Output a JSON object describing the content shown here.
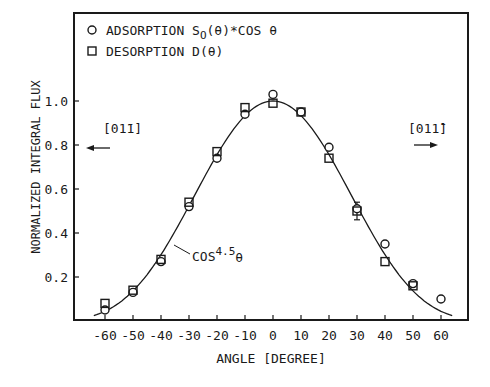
{
  "chart_data": {
    "type": "scatter",
    "title": "",
    "xlabel": "ANGLE [DEGREE]",
    "ylabel": "NORMALIZED INTEGRAL FLUX",
    "xlim": [
      -65,
      69
    ],
    "ylim": [
      0,
      1.0
    ],
    "x_ticks": [
      -60,
      -50,
      -40,
      -30,
      -20,
      -10,
      0,
      10,
      20,
      30,
      40,
      50,
      60
    ],
    "y_ticks": [
      0.2,
      0.4,
      0.6,
      0.8,
      1.0
    ],
    "y_tick_labels": [
      "0.2",
      "0.4",
      "0.6",
      "0.8",
      "1.0"
    ],
    "grid": false,
    "legend_position": "top-left",
    "series": [
      {
        "name": "ADSORPTION S_0(θ)*COS θ",
        "marker": "circle",
        "x": [
          -60,
          -50,
          -40,
          -30,
          -20,
          -10,
          0,
          10,
          20,
          30,
          40,
          50,
          60
        ],
        "values": [
          0.05,
          0.13,
          0.27,
          0.52,
          0.74,
          0.94,
          1.03,
          0.95,
          0.79,
          0.51,
          0.35,
          0.17,
          0.1
        ]
      },
      {
        "name": "DESORPTION D(θ)",
        "marker": "square",
        "x": [
          -60,
          -50,
          -40,
          -30,
          -20,
          -10,
          0,
          10,
          20,
          30,
          40,
          50
        ],
        "values": [
          0.08,
          0.14,
          0.28,
          0.54,
          0.77,
          0.97,
          0.99,
          0.95,
          0.74,
          0.5,
          0.27,
          0.16
        ]
      },
      {
        "name": "COS^4.5 θ",
        "type": "line",
        "function": "cos(theta)^4.5",
        "x_range": [
          -64,
          64
        ]
      }
    ],
    "error_bars": [
      {
        "x": 30,
        "low": 0.46,
        "high": 0.54
      }
    ],
    "annotations": [
      {
        "text": "COS^4.5 θ",
        "anchor_x": -35,
        "anchor_y": 0.35
      },
      {
        "text": "[0 1̄ 1]",
        "arrow": "left",
        "position": "upper-left"
      },
      {
        "text": "[0 1 1̄]",
        "arrow": "right",
        "position": "upper-right"
      }
    ]
  },
  "legend": {
    "adsorption_prefix": "ADSORPTION S",
    "adsorption_sub": "O",
    "adsorption_suffix": "(θ)*COS θ",
    "desorption": "DESORPTION D(θ)"
  },
  "labels": {
    "xlabel": "ANGLE [DEGREE]",
    "ylabel": "NORMALIZED INTEGRAL FLUX",
    "curve_base": "COS",
    "curve_exp": "4.5",
    "curve_var": "θ",
    "dir_left": "[01̄1]",
    "dir_right": "[011̄]"
  }
}
